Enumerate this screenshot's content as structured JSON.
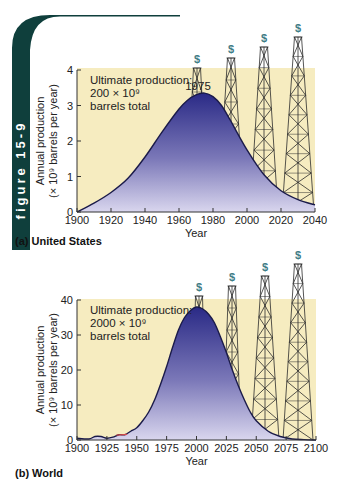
{
  "figure_tab": {
    "label": "figure 15-9",
    "color": "#0f3f3c"
  },
  "colors": {
    "background_band": "#f6ecc0",
    "fill_top": "#2a2a86",
    "fill_bottom": "#d9d6ee",
    "curve": "#1b1b4a",
    "derrick": "#2b2b2b",
    "dollar": "#3f7d86",
    "early_data_red": "#d44a4a"
  },
  "chart_data": [
    {
      "type": "area",
      "panel_label": "(a) United States",
      "title": "",
      "xlabel": "Year",
      "ylabel_line1": "Annual production",
      "ylabel_line2": "(× 10⁹ barrels per year)",
      "xlim": [
        1900,
        2040
      ],
      "ylim": [
        0,
        4
      ],
      "xticks": [
        1900,
        1920,
        1940,
        1960,
        1980,
        2000,
        2020,
        2040
      ],
      "yticks": [
        0,
        1,
        2,
        3,
        4
      ],
      "annotation": [
        "Ultimate production:",
        "200 × 10⁹",
        "barrels total"
      ],
      "peak_label": "1975",
      "x": [
        1900,
        1910,
        1920,
        1930,
        1940,
        1950,
        1960,
        1965,
        1970,
        1975,
        1980,
        1985,
        1990,
        2000,
        2010,
        2020,
        2030,
        2040
      ],
      "values": [
        0.0,
        0.25,
        0.55,
        0.95,
        1.55,
        2.25,
        2.9,
        3.15,
        3.3,
        3.35,
        3.25,
        3.0,
        2.6,
        1.75,
        1.05,
        0.6,
        0.35,
        0.2
      ],
      "derricks": [
        {
          "x_center_px": 197,
          "top_px": 68,
          "half_base_px": 11
        },
        {
          "x_center_px": 231,
          "top_px": 58,
          "half_base_px": 13
        },
        {
          "x_center_px": 264,
          "top_px": 47,
          "half_base_px": 14
        },
        {
          "x_center_px": 298,
          "top_px": 37,
          "half_base_px": 16
        }
      ]
    },
    {
      "type": "area",
      "panel_label": "(b) World",
      "title": "",
      "xlabel": "Year",
      "ylabel_line1": "Annual production",
      "ylabel_line2": "(× 10⁹ barrels per year)",
      "xlim": [
        1900,
        2100
      ],
      "ylim": [
        0,
        40
      ],
      "xticks": [
        1900,
        1925,
        1950,
        1975,
        2000,
        2025,
        2050,
        2075,
        2100
      ],
      "yticks": [
        0,
        10,
        20,
        30,
        40
      ],
      "annotation": [
        "Ultimate production:",
        "2000 × 10⁹",
        "barrels total"
      ],
      "x": [
        1900,
        1910,
        1915,
        1920,
        1925,
        1930,
        1935,
        1940,
        1945,
        1950,
        1955,
        1960,
        1965,
        1970,
        1975,
        1980,
        1985,
        1990,
        1995,
        2000,
        2005,
        2010,
        2015,
        2020,
        2025,
        2030,
        2035,
        2040,
        2045,
        2050,
        2060,
        2070,
        2080,
        2090,
        2100
      ],
      "values": [
        0.5,
        0.3,
        1.0,
        1.0,
        0.5,
        0.8,
        1.5,
        1.5,
        2.5,
        3.5,
        5.5,
        8.0,
        11.5,
        16.0,
        21.0,
        26.5,
        31.5,
        35.0,
        37.0,
        38.0,
        37.5,
        36.0,
        33.5,
        29.5,
        25.0,
        20.0,
        15.5,
        11.5,
        8.0,
        5.5,
        2.5,
        1.0,
        0.3,
        0.1,
        0.0
      ],
      "derricks": [
        {
          "x_center_px": 199,
          "top_px": 296,
          "half_base_px": 7
        },
        {
          "x_center_px": 232,
          "top_px": 286,
          "half_base_px": 9
        },
        {
          "x_center_px": 265,
          "top_px": 276,
          "half_base_px": 14
        },
        {
          "x_center_px": 298,
          "top_px": 264,
          "half_base_px": 15
        }
      ]
    }
  ]
}
